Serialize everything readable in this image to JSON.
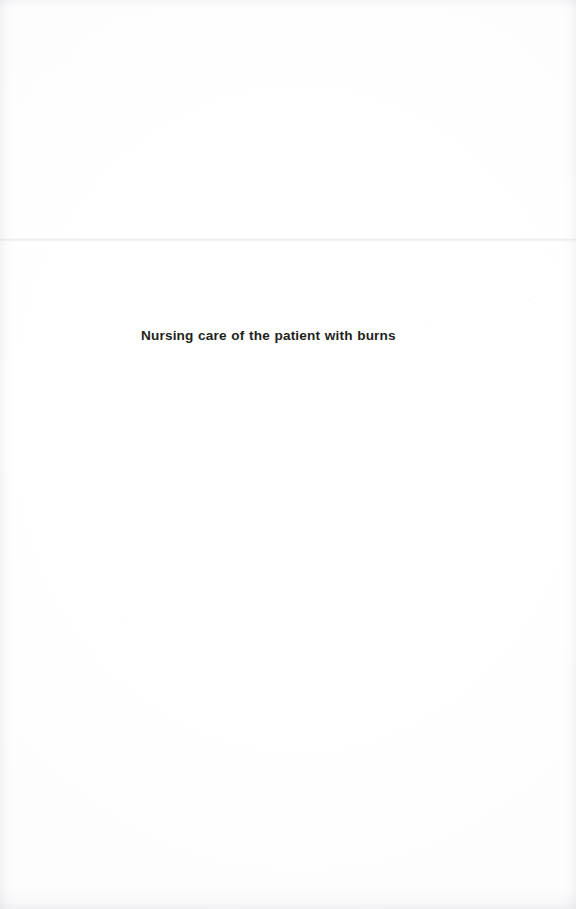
{
  "page": {
    "kind": "scanned-book-page",
    "background_color": "#ffffff",
    "text_color": "#1f1f20",
    "width": 576,
    "height": 909
  },
  "content": {
    "chapter_title": "Nursing care of the patient with burns"
  },
  "artifacts": {
    "seam_label": "page-fold-seam",
    "grain_label": "scan-grain",
    "edge_top_label": "top-edge-shadow",
    "edge_left_label": "left-edge-shadow",
    "edge_right_label": "right-edge-shadow",
    "edge_bottom_label": "bottom-edge-shadow"
  }
}
